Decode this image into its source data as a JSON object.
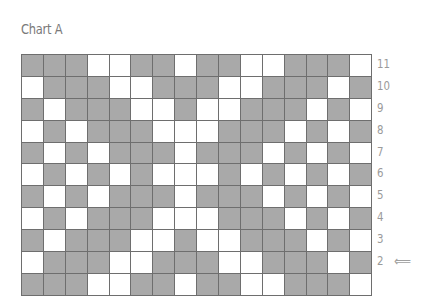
{
  "title": "Chart A",
  "colors": {
    "filled": "#a9a9a9",
    "empty": "#ffffff",
    "gridline": "#6e6e6e",
    "label": "#9a9a9a"
  },
  "chart": {
    "columns": 16,
    "rows": [
      {
        "label": "11",
        "cells": "1110011011001110",
        "arrow": ""
      },
      {
        "label": "10",
        "cells": "0111001110011101",
        "arrow": ""
      },
      {
        "label": "9",
        "cells": "1011100100111010",
        "arrow": ""
      },
      {
        "label": "8",
        "cells": "0101110001110101",
        "arrow": ""
      },
      {
        "label": "7",
        "cells": "1010111011101010",
        "arrow": ""
      },
      {
        "label": "6",
        "cells": "0101010001010101",
        "arrow": ""
      },
      {
        "label": "5",
        "cells": "1010111011101010",
        "arrow": ""
      },
      {
        "label": "4",
        "cells": "0101110001110101",
        "arrow": ""
      },
      {
        "label": "3",
        "cells": "1011100100111010",
        "arrow": ""
      },
      {
        "label": "2",
        "cells": "0111001110011101",
        "arrow": "⟸"
      },
      {
        "label": "",
        "cells": "1110011011001110",
        "arrow": ""
      }
    ]
  }
}
